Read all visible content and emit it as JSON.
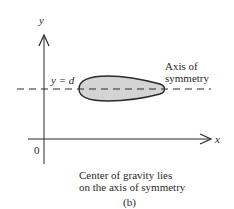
{
  "figure": {
    "labels": {
      "y_axis": "y",
      "x_axis": "x",
      "origin": "0",
      "line_label": "y = d",
      "axis_label_line1": "Axis of",
      "axis_label_line2": "symmetry"
    },
    "caption": {
      "line1": "Center of gravity lies",
      "line2": "on the axis of symmetry",
      "sublabel": "(b)"
    },
    "colors": {
      "stroke": "#2a2a2a",
      "shape_fill": "#d4d4d4",
      "background": "#ffffff"
    }
  }
}
